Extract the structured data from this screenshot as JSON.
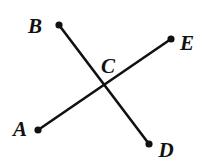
{
  "figure": {
    "background_color": "#ffffff",
    "stroke_color": "#111111",
    "canvas": {
      "width": 202,
      "height": 164
    }
  },
  "chart_data": {
    "type": "diagram",
    "xlabel": "",
    "ylabel": "",
    "xlim": [
      0,
      202
    ],
    "ylim": [
      0,
      164
    ],
    "grid": false,
    "legend": "none",
    "points": [
      {
        "id": "A",
        "label": "A",
        "x": 38,
        "y": 130,
        "label_x": 20,
        "label_y": 136,
        "has_dot": true
      },
      {
        "id": "B",
        "label": "B",
        "x": 59,
        "y": 25,
        "label_x": 35,
        "label_y": 33,
        "has_dot": true
      },
      {
        "id": "C",
        "label": "C",
        "x": 104,
        "y": 86,
        "label_x": 108,
        "label_y": 73,
        "has_dot": false
      },
      {
        "id": "D",
        "label": "D",
        "x": 149,
        "y": 144,
        "label_x": 166,
        "label_y": 157,
        "has_dot": true
      },
      {
        "id": "E",
        "label": "E",
        "x": 171,
        "y": 39,
        "label_x": 187,
        "label_y": 50,
        "has_dot": true
      }
    ],
    "segments": [
      {
        "id": "BD",
        "label": "BD",
        "from": "B",
        "to": "D",
        "x1": 59,
        "y1": 25,
        "x2": 149,
        "y2": 144
      },
      {
        "id": "AE",
        "label": "AE",
        "from": "A",
        "to": "E",
        "x1": 38,
        "y1": 130,
        "x2": 171,
        "y2": 39
      }
    ],
    "intersection": {
      "label": "C",
      "x": 104,
      "y": 86
    },
    "dot_radius": 3.6,
    "line_width": 2.6
  }
}
